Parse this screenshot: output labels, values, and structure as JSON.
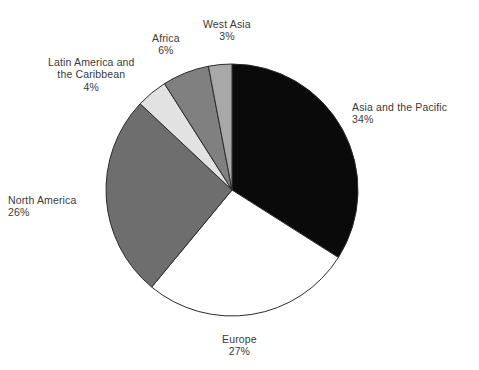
{
  "chart_data": {
    "type": "pie",
    "title": "",
    "subtitle": "",
    "xlabel": "",
    "ylabel": "",
    "legend_position": "none",
    "grid": false,
    "labels_show_percent": true,
    "start_angle_deg": 0,
    "direction": "clockwise",
    "categories": [
      "Asia and the Pacific",
      "Europe",
      "North America",
      "Latin America and the Caribbean",
      "Africa",
      "West Asia"
    ],
    "values": [
      34,
      27,
      26,
      4,
      6,
      3
    ],
    "value_labels": [
      "34%",
      "27%",
      "26%",
      "4%",
      "6%",
      "3%"
    ],
    "colors": [
      "#0a0a0a",
      "#ffffff",
      "#6e6e6e",
      "#e2e2e2",
      "#808080",
      "#a8a8a8"
    ],
    "slices": [
      {
        "name": "Asia and the Pacific",
        "label_lines": [
          "Asia and the Pacific"
        ],
        "value": 34,
        "value_label": "34%",
        "color": "#0a0a0a"
      },
      {
        "name": "Europe",
        "label_lines": [
          "Europe"
        ],
        "value": 27,
        "value_label": "27%",
        "color": "#ffffff"
      },
      {
        "name": "North America",
        "label_lines": [
          "North America"
        ],
        "value": 26,
        "value_label": "26%",
        "color": "#6e6e6e"
      },
      {
        "name": "Latin America and the Caribbean",
        "label_lines": [
          "Latin America and",
          "the Caribbean"
        ],
        "value": 4,
        "value_label": "4%",
        "color": "#e2e2e2"
      },
      {
        "name": "Africa",
        "label_lines": [
          "Africa"
        ],
        "value": 6,
        "value_label": "6%",
        "color": "#808080"
      },
      {
        "name": "West Asia",
        "label_lines": [
          "West Asia"
        ],
        "value": 3,
        "value_label": "3%",
        "color": "#a8a8a8"
      }
    ]
  },
  "labels": {
    "asia": {
      "line1": "Asia and the Pacific",
      "value": "34%"
    },
    "europe": {
      "line1": "Europe",
      "value": "27%"
    },
    "north_america": {
      "line1": "North America",
      "value": "26%"
    },
    "latin_america": {
      "line1": "Latin America and",
      "line2": "the Caribbean",
      "value": "4%"
    },
    "africa": {
      "line1": "Africa",
      "value": "6%"
    },
    "west_asia": {
      "line1": "West Asia",
      "value": "3%"
    }
  },
  "style": {
    "background": "#ffffff",
    "text_color": "#3a3a3a",
    "outline_color": "#2b2b2b"
  },
  "geometry": {
    "center_x": 232,
    "center_y": 190,
    "radius": 126
  }
}
